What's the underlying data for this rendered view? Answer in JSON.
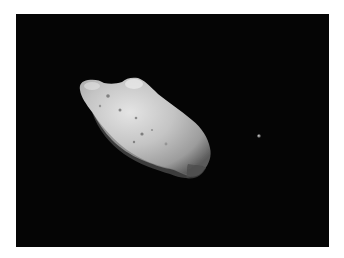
{
  "image": {
    "subject": "asteroid with small moon in space",
    "background_color": "#050505",
    "margin_color": "#ffffff",
    "asteroid": {
      "label": "asteroid",
      "base_color": "#bdbdbd",
      "highlight_color": "#e6e6e6",
      "shadow_color": "#3a3a3a"
    },
    "moon": {
      "label": "moon",
      "color": "#9a9a9a"
    }
  }
}
